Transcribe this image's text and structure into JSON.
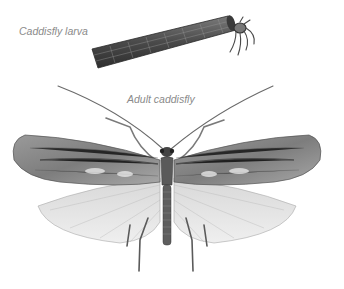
{
  "labels": {
    "larva": "Caddisfly larva",
    "adult": "Adult caddisfly"
  },
  "colors": {
    "background": "#ffffff",
    "label_text": "#8a8a8a",
    "case_dark": "#3a3a3a",
    "case_mid": "#6b6b6b",
    "forewing": "#8c8c8c",
    "forewing_dark": "#4a4a4a",
    "hindwing": "#e4e4e4",
    "body": "#5a5a5a"
  },
  "illustration": {
    "subjects": [
      "caddisfly-larva-in-case",
      "adult-caddisfly"
    ]
  }
}
